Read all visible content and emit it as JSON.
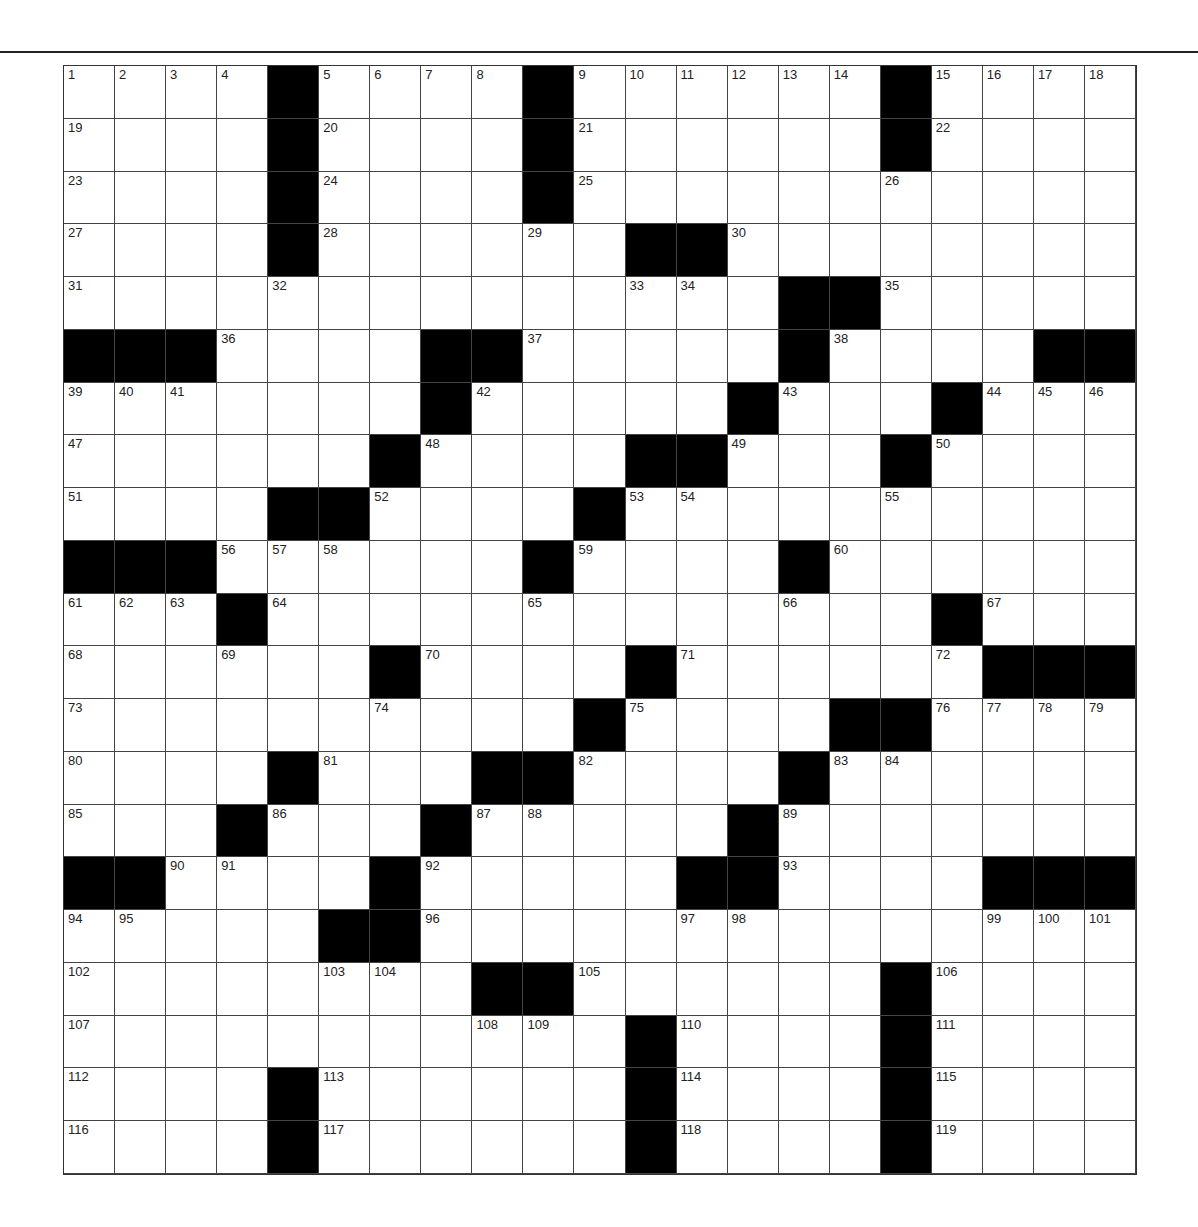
{
  "puzzle": {
    "rows": 21,
    "cols": 21,
    "block_color": "#000000",
    "cell_color": "#ffffff",
    "grid": [
      [
        "1",
        "2",
        "3",
        "4",
        "#",
        "5",
        "6",
        "7",
        "8",
        "#",
        "9",
        "10",
        "11",
        "12",
        "13",
        "14",
        "#",
        "15",
        "16",
        "17",
        "18"
      ],
      [
        "19",
        "",
        "",
        "",
        "#",
        "20",
        "",
        "",
        "",
        "#",
        "21",
        "",
        "",
        "",
        "",
        "",
        "#",
        "22",
        "",
        "",
        ""
      ],
      [
        "23",
        "",
        "",
        "",
        "#",
        "24",
        "",
        "",
        "",
        "#",
        "25",
        "",
        "",
        "",
        "",
        "",
        "26",
        "",
        "",
        "",
        ""
      ],
      [
        "27",
        "",
        "",
        "",
        "#",
        "28",
        "",
        "",
        "",
        "29",
        "",
        "#",
        "#",
        "30",
        "",
        "",
        "",
        "",
        "",
        "",
        ""
      ],
      [
        "31",
        "",
        "",
        "",
        "32",
        "",
        "",
        "",
        "",
        "",
        "",
        "33",
        "34",
        "",
        "#",
        "#",
        "35",
        "",
        "",
        "",
        ""
      ],
      [
        "#",
        "#",
        "#",
        "36",
        "",
        "",
        "",
        "#",
        "#",
        "37",
        "",
        "",
        "",
        "",
        "#",
        "38",
        "",
        "",
        "",
        "#",
        "#"
      ],
      [
        "39",
        "40",
        "41",
        "",
        "",
        "",
        "",
        "#",
        "42",
        "",
        "",
        "",
        "",
        "#",
        "43",
        "",
        "",
        "#",
        "44",
        "45",
        "46"
      ],
      [
        "47",
        "",
        "",
        "",
        "",
        "",
        "#",
        "48",
        "",
        "",
        "",
        "#",
        "#",
        "49",
        "",
        "",
        "#",
        "50",
        "",
        "",
        ""
      ],
      [
        "51",
        "",
        "",
        "",
        "#",
        "#",
        "52",
        "",
        "",
        "",
        "#",
        "53",
        "54",
        "",
        "",
        "",
        "55",
        "",
        "",
        "",
        ""
      ],
      [
        "#",
        "#",
        "#",
        "56",
        "57",
        "58",
        "",
        "",
        "",
        "#",
        "59",
        "",
        "",
        "",
        "#",
        "60",
        "",
        "",
        "",
        "",
        ""
      ],
      [
        "61",
        "62",
        "63",
        "#",
        "64",
        "",
        "",
        "",
        "",
        "65",
        "",
        "",
        "",
        "",
        "66",
        "",
        "",
        "#",
        "67",
        "",
        ""
      ],
      [
        "68",
        "",
        "",
        "69",
        "",
        "",
        "#",
        "70",
        "",
        "",
        "",
        "#",
        "71",
        "",
        "",
        "",
        "",
        "72",
        "#",
        "#",
        "#"
      ],
      [
        "73",
        "",
        "",
        "",
        "",
        "",
        "74",
        "",
        "",
        "",
        "#",
        "75",
        "",
        "",
        "",
        "#",
        "#",
        "76",
        "77",
        "78",
        "79"
      ],
      [
        "80",
        "",
        "",
        "",
        "#",
        "81",
        "",
        "",
        "#",
        "#",
        "82",
        "",
        "",
        "",
        "#",
        "83",
        "84",
        "",
        "",
        "",
        ""
      ],
      [
        "85",
        "",
        "",
        "#",
        "86",
        "",
        "",
        "#",
        "87",
        "88",
        "",
        "",
        "",
        "#",
        "89",
        "",
        "",
        "",
        "",
        "",
        ""
      ],
      [
        "#",
        "#",
        "90",
        "91",
        "",
        "",
        "#",
        "92",
        "",
        "",
        "",
        "",
        "#",
        "#",
        "93",
        "",
        "",
        "",
        "#",
        "#",
        "#"
      ],
      [
        "94",
        "95",
        "",
        "",
        "",
        "#",
        "#",
        "96",
        "",
        "",
        "",
        "",
        "97",
        "98",
        "",
        "",
        "",
        "",
        "99",
        "100",
        "101"
      ],
      [
        "102",
        "",
        "",
        "",
        "",
        "103",
        "104",
        "",
        "#",
        "#",
        "105",
        "",
        "",
        "",
        "",
        "",
        "#",
        "106",
        "",
        "",
        ""
      ],
      [
        "107",
        "",
        "",
        "",
        "",
        "",
        "",
        "",
        "108",
        "109",
        "",
        "#",
        "110",
        "",
        "",
        "",
        "#",
        "111",
        "",
        "",
        ""
      ],
      [
        "112",
        "",
        "",
        "",
        "#",
        "113",
        "",
        "",
        "",
        "",
        "",
        "#",
        "114",
        "",
        "",
        "",
        "#",
        "115",
        "",
        "",
        ""
      ],
      [
        "116",
        "",
        "",
        "",
        "#",
        "117",
        "",
        "",
        "",
        "",
        "",
        "#",
        "118",
        "",
        "",
        "",
        "#",
        "119",
        "",
        "",
        ""
      ]
    ]
  }
}
